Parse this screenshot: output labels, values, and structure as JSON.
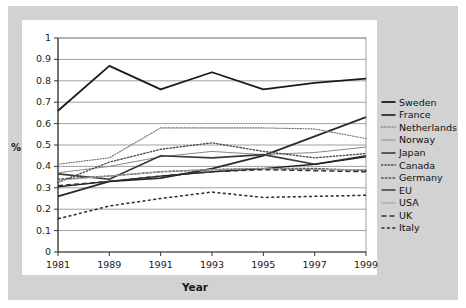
{
  "chart_data": {
    "type": "line",
    "title": "",
    "xlabel": "Year",
    "ylabel": "%",
    "categories": [
      "1981",
      "1989",
      "1991",
      "1993",
      "1995",
      "1997",
      "1999"
    ],
    "x": [
      1981,
      1989,
      1991,
      1993,
      1995,
      1997,
      1999
    ],
    "ylim": [
      0,
      1
    ],
    "ytick_values": [
      0,
      0.1,
      0.2,
      0.3,
      0.4,
      0.5,
      0.6,
      0.7,
      0.8,
      0.9,
      1
    ],
    "ytick_labels": [
      "0",
      "0.1",
      "0.2",
      "0.3",
      "0.4",
      "0.5",
      "0.6",
      "0.7",
      "0.8",
      "0.9",
      "1"
    ],
    "grid": "horizontal",
    "legend_position": "right",
    "series": [
      {
        "name": "Sweden",
        "style": "solid",
        "width": 1.8,
        "color": "#1a1a1a",
        "values": [
          0.66,
          0.87,
          0.76,
          0.84,
          0.76,
          0.79,
          0.81
        ]
      },
      {
        "name": "France",
        "style": "solid",
        "width": 1.8,
        "color": "#2b2b2b",
        "values": [
          0.26,
          0.33,
          0.345,
          0.39,
          0.45,
          0.54,
          0.63
        ]
      },
      {
        "name": "Netherlands",
        "style": "dotted",
        "width": 1.1,
        "color": "#6b6b6b",
        "values": [
          0.41,
          0.44,
          0.58,
          0.58,
          0.58,
          0.575,
          0.53
        ]
      },
      {
        "name": "Norway",
        "style": "solid",
        "width": 1.0,
        "color": "#8a8a8a",
        "values": [
          0.37,
          0.4,
          0.445,
          0.47,
          0.455,
          0.465,
          0.49
        ]
      },
      {
        "name": "Japan",
        "style": "solid",
        "width": 1.6,
        "color": "#3a3a3a",
        "values": [
          0.365,
          0.34,
          0.45,
          0.44,
          0.455,
          0.41,
          0.45
        ]
      },
      {
        "name": "Canada",
        "style": "dotted",
        "width": 1.4,
        "color": "#4d4d4d",
        "values": [
          0.325,
          0.42,
          0.48,
          0.51,
          0.47,
          0.44,
          0.46
        ]
      },
      {
        "name": "Germany",
        "style": "dotted",
        "width": 1.6,
        "color": "#555555",
        "values": [
          0.34,
          0.355,
          0.375,
          0.385,
          0.39,
          0.39,
          0.38
        ]
      },
      {
        "name": "EU",
        "style": "solid",
        "width": 1.3,
        "color": "#222222",
        "values": [
          0.305,
          0.33,
          0.355,
          0.375,
          0.39,
          0.41,
          0.445
        ]
      },
      {
        "name": "USA",
        "style": "solid",
        "width": 1.0,
        "color": "#9a9a9a",
        "values": [
          0.335,
          0.355,
          0.375,
          0.385,
          0.39,
          0.385,
          0.385
        ]
      },
      {
        "name": "UK",
        "style": "dashed",
        "width": 1.5,
        "color": "#333333",
        "values": [
          0.31,
          0.33,
          0.355,
          0.375,
          0.385,
          0.38,
          0.375
        ]
      },
      {
        "name": "Italy",
        "style": "dashed-fine",
        "width": 1.5,
        "color": "#2a2a2a",
        "values": [
          0.155,
          0.215,
          0.25,
          0.28,
          0.255,
          0.26,
          0.265
        ]
      }
    ]
  },
  "legend": {
    "items": [
      {
        "label": "Sweden"
      },
      {
        "label": "France"
      },
      {
        "label": "Netherlands"
      },
      {
        "label": "Norway"
      },
      {
        "label": "Japan"
      },
      {
        "label": "Canada"
      },
      {
        "label": "Germany"
      },
      {
        "label": "EU"
      },
      {
        "label": "USA"
      },
      {
        "label": "UK"
      },
      {
        "label": "Italy"
      }
    ]
  },
  "colors": {
    "mat": "#d2d2d2",
    "card": "#ffffff",
    "grid": "#888888",
    "axis": "#333333",
    "text": "#1a1a1a"
  }
}
